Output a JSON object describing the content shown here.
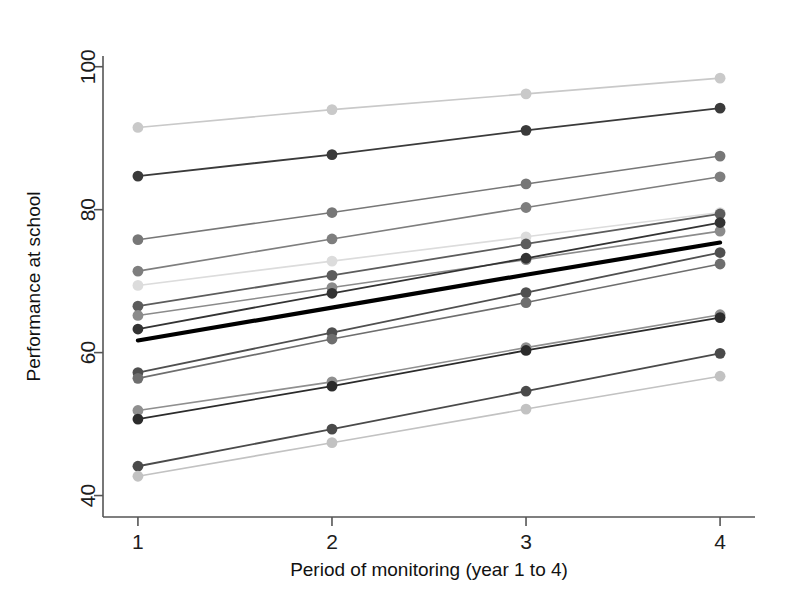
{
  "figure": {
    "caption": ""
  },
  "chart_data": {
    "type": "line",
    "title": "",
    "xlabel": "Period of monitoring (year 1 to 4)",
    "ylabel": "Performance at school",
    "x": [
      1,
      2,
      3,
      4
    ],
    "xticklabels": [
      "1",
      "2",
      "3",
      "4"
    ],
    "yticklabels": [
      "40",
      "60",
      "80",
      "100"
    ],
    "yticks": [
      40,
      60,
      80,
      100
    ],
    "xlim": [
      0.82,
      4.18
    ],
    "ylim": [
      37.0,
      101.5
    ],
    "grid": false,
    "legend": false,
    "legend_position": "none",
    "marker": "circle",
    "annotations": [
      "Bold black line is the overall mean trajectory"
    ],
    "series": [
      {
        "name": "Subject 1",
        "color": "#c9c9c9",
        "width": 1.6,
        "values": [
          91.5,
          94.0,
          96.2,
          98.4
        ]
      },
      {
        "name": "Subject 2",
        "color": "#3a3a3a",
        "width": 1.8,
        "values": [
          84.7,
          87.7,
          91.1,
          94.2
        ]
      },
      {
        "name": "Subject 3",
        "color": "#777777",
        "width": 1.6,
        "values": [
          75.8,
          79.6,
          83.6,
          87.5
        ]
      },
      {
        "name": "Subject 4",
        "color": "#7e7e7e",
        "width": 1.6,
        "values": [
          71.4,
          75.9,
          80.3,
          84.6
        ]
      },
      {
        "name": "Subject 5",
        "color": "#dcdcdc",
        "width": 1.6,
        "values": [
          69.4,
          72.8,
          76.2,
          79.6
        ]
      },
      {
        "name": "Subject 6",
        "color": "#5c5c5c",
        "width": 1.8,
        "values": [
          66.5,
          70.8,
          75.2,
          79.4
        ]
      },
      {
        "name": "Subject 7",
        "color": "#8b8b8b",
        "width": 1.6,
        "values": [
          65.2,
          69.1,
          73.0,
          77.0
        ]
      },
      {
        "name": "Subject 8",
        "color": "#333333",
        "width": 1.8,
        "values": [
          63.3,
          68.3,
          73.2,
          78.2
        ]
      },
      {
        "name": "Mean",
        "color": "#000000",
        "width": 4.2,
        "values": [
          61.7,
          66.3,
          70.9,
          75.4
        ]
      },
      {
        "name": "Subject 9",
        "color": "#4f4f4f",
        "width": 1.8,
        "values": [
          57.2,
          62.8,
          68.4,
          74.0
        ]
      },
      {
        "name": "Subject 10",
        "color": "#6e6e6e",
        "width": 1.6,
        "values": [
          56.4,
          61.9,
          67.0,
          72.4
        ]
      },
      {
        "name": "Subject 11",
        "color": "#8f8f8f",
        "width": 1.6,
        "values": [
          51.9,
          55.9,
          60.7,
          65.3
        ]
      },
      {
        "name": "Subject 12",
        "color": "#2b2b2b",
        "width": 1.8,
        "values": [
          50.7,
          55.3,
          60.3,
          64.9
        ]
      },
      {
        "name": "Subject 13",
        "color": "#4a4a4a",
        "width": 1.8,
        "values": [
          44.1,
          49.3,
          54.6,
          59.9
        ]
      },
      {
        "name": "Subject 14",
        "color": "#c2c2c2",
        "width": 1.6,
        "values": [
          42.7,
          47.4,
          52.1,
          56.7
        ]
      }
    ]
  }
}
